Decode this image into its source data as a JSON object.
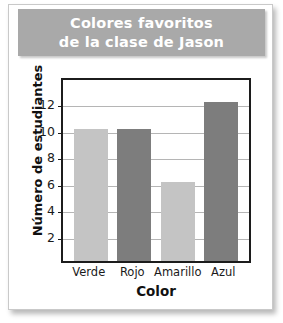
{
  "card": {
    "background_color": "#ffffff",
    "border_color": "#c9c9c9"
  },
  "title": {
    "banner_color": "#a9a9a9",
    "text_color": "#ffffff",
    "line1": "Colores favoritos",
    "line2": "de la clase de Jason",
    "full": "Colores favoritos de la clase de Jason"
  },
  "chart_data": {
    "type": "bar",
    "title": "Colores favoritos de la clase de Jason",
    "categories": [
      "Verde",
      "Rojo",
      "Amarillo",
      "Azul"
    ],
    "values": [
      10,
      10,
      6,
      12
    ],
    "bar_colors": [
      "#c4c4c4",
      "#7d7d7d",
      "#c4c4c4",
      "#7d7d7d"
    ],
    "xlabel": "Color",
    "ylabel": "Número de estudiantes",
    "ylim": [
      0,
      14
    ],
    "yticks": [
      2,
      4,
      6,
      8,
      10,
      12
    ],
    "ytick_labels": [
      "2",
      "4",
      "6",
      "8",
      "10",
      "12"
    ],
    "grid": true,
    "grid_color": "#b5b5b5",
    "legend": null,
    "axis_color": "#1c1c1c",
    "plot_background": "#ffffff"
  }
}
